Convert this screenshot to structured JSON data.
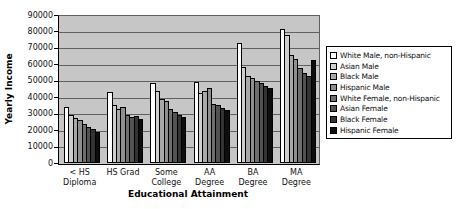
{
  "chart_data": {
    "type": "bar",
    "title": "",
    "xlabel": "Educational Attainment",
    "ylabel": "Yearly Income",
    "ylim": [
      0,
      90000
    ],
    "ytick_step": 10000,
    "yticks": [
      90000,
      80000,
      70000,
      60000,
      50000,
      40000,
      30000,
      20000,
      10000,
      0
    ],
    "grid": true,
    "legend_position": "right",
    "plot_bg": "#c6c6c6",
    "gridline_color": "#606060",
    "axis_color": "#000000",
    "categories": [
      "< HS Diploma",
      "HS Grad",
      "Some College",
      "AA Degree",
      "BA Degree",
      "MA Degree"
    ],
    "category_label_lines": [
      [
        "< HS",
        "Diploma"
      ],
      [
        "HS Grad"
      ],
      [
        "Some",
        "College"
      ],
      [
        "AA",
        "Degree"
      ],
      [
        "BA",
        "Degree"
      ],
      [
        "MA",
        "Degree"
      ]
    ],
    "series": [
      {
        "name": "White Male, non-Hispanic",
        "color": "#ffffff",
        "values": [
          34000,
          43000,
          48500,
          49000,
          73000,
          81500
        ]
      },
      {
        "name": "Asian Male",
        "color": "#cfcfcf",
        "values": [
          29000,
          35500,
          44000,
          42500,
          58500,
          78000
        ]
      },
      {
        "name": "Black Male",
        "color": "#a8a8a8",
        "values": [
          27500,
          33000,
          39000,
          44000,
          53000,
          66000
        ]
      },
      {
        "name": "Hispanic Male",
        "color": "#8f8f8f",
        "values": [
          26000,
          34000,
          38000,
          45500,
          51500,
          63500
        ]
      },
      {
        "name": "White Female, non-Hispanic",
        "color": "#6e6e6e",
        "values": [
          23500,
          29500,
          33000,
          36000,
          50000,
          57500
        ]
      },
      {
        "name": "Asian Female",
        "color": "#525252",
        "values": [
          22000,
          28000,
          31000,
          35000,
          48500,
          55000
        ]
      },
      {
        "name": "Black Female",
        "color": "#333333",
        "values": [
          20500,
          28500,
          29500,
          33500,
          47000,
          53000
        ]
      },
      {
        "name": "Hispanic Female",
        "color": "#0d0d0d",
        "values": [
          19000,
          26500,
          28000,
          32000,
          45500,
          62500
        ]
      }
    ]
  }
}
